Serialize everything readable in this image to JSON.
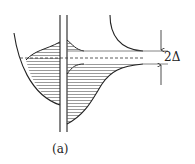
{
  "diagram": {
    "delta_label": "2Δ",
    "caption": "(a)",
    "colors": {
      "stroke": "#222222",
      "hatch": "#444444",
      "background": "#ffffff"
    }
  }
}
